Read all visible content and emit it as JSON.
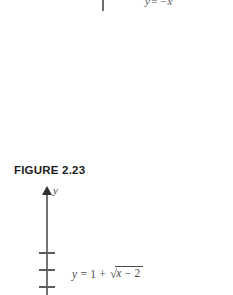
{
  "page": {
    "background_color": "#ffffff",
    "width": 233,
    "height": 295
  },
  "top_fragment": {
    "axis_stub_name": "clipped vertical axis",
    "equation": {
      "lhs": "y",
      "equals": "=",
      "rhs_sign": "−",
      "rhs_var": "x",
      "rhs_exponent": "2",
      "full_text": "y = −x²"
    }
  },
  "caption": {
    "text": "FIGURE 2.23",
    "label": "FIGURE",
    "number": "2.23",
    "color": "#1d1d1d"
  },
  "diagram": {
    "axis": {
      "label": "y",
      "orientation": "vertical",
      "arrow_direction": "up",
      "color": "#737373"
    },
    "ticks": [
      {
        "name": "tick-1"
      },
      {
        "name": "tick-2"
      },
      {
        "name": "tick-3"
      }
    ],
    "equation": {
      "lhs": "y",
      "equals": "=",
      "constant": "1",
      "plus": "+",
      "radical_sign": "√",
      "radicand_var": "x",
      "radicand_minus": "−",
      "radicand_const": "2",
      "full_text": "y = 1 + √(x − 2)"
    }
  }
}
